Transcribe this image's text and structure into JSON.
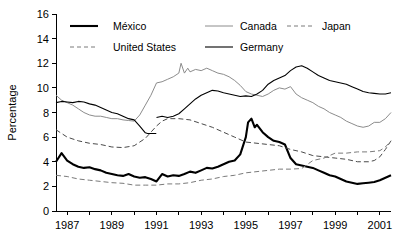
{
  "chart_data": {
    "type": "line",
    "title": "",
    "xlabel": "",
    "ylabel": "Percentage",
    "xlim": [
      1986.5,
      2001.5
    ],
    "ylim": [
      0,
      16
    ],
    "ytick_step": 2,
    "yticks": [
      0,
      2,
      4,
      6,
      8,
      10,
      12,
      14,
      16
    ],
    "ytick_labels": [
      "0",
      "2",
      "4",
      "6",
      "8",
      "10",
      "12",
      "14",
      "16"
    ],
    "xticks": [
      1987,
      1989,
      1991,
      1993,
      1995,
      1997,
      1999,
      2001
    ],
    "xtick_labels": [
      "1987",
      "1989",
      "1991",
      "1993",
      "1995",
      "1997",
      "1999",
      "2001"
    ],
    "xtick_minor_step": 1,
    "grid": false,
    "legend_position": "top-inside",
    "series": [
      {
        "name": "México",
        "color": "#000000",
        "width": 2.1,
        "dash": "none",
        "x": [
          1986.5,
          1986.75,
          1987,
          1987.25,
          1987.5,
          1987.75,
          1988,
          1988.25,
          1988.5,
          1988.75,
          1989,
          1989.25,
          1989.5,
          1989.75,
          1990,
          1990.25,
          1990.5,
          1990.75,
          1991,
          1991.25,
          1991.5,
          1991.75,
          1992,
          1992.25,
          1992.5,
          1992.75,
          1993,
          1993.25,
          1993.5,
          1993.75,
          1994,
          1994.25,
          1994.5,
          1994.75,
          1995,
          1995.1,
          1995.25,
          1995.4,
          1995.5,
          1995.75,
          1996,
          1996.25,
          1996.5,
          1996.75,
          1997,
          1997.25,
          1997.5,
          1997.75,
          1998,
          1998.25,
          1998.5,
          1998.75,
          1999,
          1999.25,
          1999.5,
          1999.75,
          2000,
          2000.25,
          2000.5,
          2000.75,
          2001,
          2001.25,
          2001.5
        ],
        "values": [
          4.0,
          4.7,
          4.1,
          3.8,
          3.6,
          3.5,
          3.55,
          3.4,
          3.3,
          3.1,
          3.0,
          2.9,
          2.85,
          3.0,
          2.8,
          2.7,
          2.75,
          2.6,
          2.4,
          3.0,
          2.8,
          2.9,
          2.85,
          3.0,
          3.2,
          3.1,
          3.3,
          3.5,
          3.45,
          3.6,
          3.8,
          4.0,
          4.1,
          4.6,
          6.0,
          7.2,
          7.5,
          6.8,
          7.0,
          6.4,
          6.0,
          5.7,
          5.6,
          5.4,
          4.3,
          3.8,
          3.7,
          3.6,
          3.5,
          3.3,
          3.1,
          2.9,
          2.8,
          2.6,
          2.4,
          2.3,
          2.2,
          2.25,
          2.3,
          2.35,
          2.5,
          2.7,
          2.9
        ]
      },
      {
        "name": "United States",
        "color": "#4a4a4a",
        "width": 1.0,
        "dash": "5,3",
        "x": [
          1986.5,
          1986.75,
          1987,
          1987.5,
          1988,
          1988.5,
          1989,
          1989.5,
          1990,
          1990.5,
          1991,
          1991.25,
          1991.5,
          1992,
          1992.5,
          1993,
          1993.5,
          1994,
          1994.5,
          1995,
          1995.5,
          1996,
          1996.5,
          1997,
          1997.5,
          1998,
          1998.5,
          1999,
          1999.5,
          2000,
          2000.5,
          2000.75,
          2001,
          2001.25,
          2001.5
        ],
        "values": [
          6.6,
          6.3,
          6.0,
          5.7,
          5.5,
          5.4,
          5.2,
          5.15,
          5.3,
          5.9,
          6.9,
          7.3,
          7.5,
          7.5,
          7.4,
          7.1,
          6.8,
          6.4,
          6.0,
          5.6,
          5.5,
          5.4,
          5.3,
          5.0,
          4.8,
          4.5,
          4.4,
          4.3,
          4.2,
          4.0,
          4.0,
          4.1,
          4.4,
          5.0,
          5.7
        ]
      },
      {
        "name": "Canada",
        "color": "#8c8c8c",
        "width": 1.0,
        "dash": "none",
        "x": [
          1986.5,
          1986.75,
          1987,
          1987.25,
          1987.5,
          1987.75,
          1988,
          1988.25,
          1988.5,
          1988.75,
          1989,
          1989.25,
          1989.5,
          1989.75,
          1990,
          1990.25,
          1990.5,
          1990.75,
          1991,
          1991.25,
          1991.5,
          1991.75,
          1992,
          1992.1,
          1992.25,
          1992.4,
          1992.5,
          1992.75,
          1993,
          1993.25,
          1993.5,
          1993.75,
          1994,
          1994.25,
          1994.5,
          1994.75,
          1995,
          1995.25,
          1995.5,
          1995.75,
          1996,
          1996.25,
          1996.5,
          1996.75,
          1997,
          1997.25,
          1997.5,
          1997.75,
          1998,
          1998.25,
          1998.5,
          1998.75,
          1999,
          1999.25,
          1999.5,
          1999.75,
          2000,
          2000.25,
          2000.5,
          2000.75,
          2001,
          2001.25,
          2001.5
        ],
        "values": [
          9.4,
          9.0,
          8.8,
          8.6,
          8.3,
          8.0,
          7.8,
          7.7,
          7.7,
          7.6,
          7.5,
          7.5,
          7.4,
          7.35,
          7.3,
          7.8,
          8.6,
          9.4,
          10.4,
          10.5,
          10.7,
          10.9,
          11.2,
          12.0,
          11.2,
          11.6,
          11.3,
          11.5,
          11.4,
          11.6,
          11.4,
          11.2,
          11.1,
          10.9,
          10.6,
          10.2,
          9.7,
          9.5,
          9.4,
          9.3,
          9.5,
          9.8,
          10.0,
          9.9,
          10.1,
          9.5,
          9.2,
          9.0,
          8.8,
          8.5,
          8.3,
          8.0,
          7.8,
          7.6,
          7.3,
          7.1,
          6.9,
          6.8,
          6.9,
          7.2,
          7.2,
          7.5,
          8.0
        ]
      },
      {
        "name": "Germany",
        "color": "#000000",
        "width": 1.1,
        "dash": "none",
        "x": [
          1986.5,
          1986.75,
          1987,
          1987.25,
          1987.5,
          1987.75,
          1988,
          1988.25,
          1988.5,
          1988.75,
          1989,
          1989.25,
          1989.5,
          1989.75,
          1990,
          1990.25,
          1990.5,
          1990.6,
          1990.99
        ],
        "values": [
          8.8,
          8.9,
          8.85,
          8.8,
          8.9,
          8.85,
          8.7,
          8.6,
          8.4,
          8.2,
          8.0,
          7.9,
          7.7,
          7.5,
          7.4,
          6.9,
          6.35,
          6.3,
          6.3
        ],
        "segment2_x": [
          1991,
          1991.25,
          1991.5,
          1991.75,
          1992,
          1992.25,
          1992.5,
          1992.75,
          1993,
          1993.25,
          1993.5,
          1993.75,
          1994,
          1994.25,
          1994.5,
          1994.75,
          1995,
          1995.25,
          1995.5,
          1995.75,
          1996,
          1996.25,
          1996.5,
          1996.75,
          1997,
          1997.25,
          1997.5,
          1997.75,
          1998,
          1998.25,
          1998.5,
          1998.75,
          1999,
          1999.25,
          1999.5,
          1999.75,
          2000,
          2000.25,
          2000.5,
          2000.75,
          2001,
          2001.25,
          2001.5
        ],
        "segment2_values": [
          7.6,
          7.7,
          7.6,
          7.7,
          7.9,
          8.3,
          8.7,
          9.1,
          9.4,
          9.6,
          9.8,
          9.75,
          9.6,
          9.5,
          9.4,
          9.3,
          9.35,
          9.3,
          9.5,
          9.8,
          10.3,
          10.6,
          10.8,
          11.0,
          11.4,
          11.7,
          11.8,
          11.6,
          11.3,
          11.0,
          10.8,
          10.6,
          10.5,
          10.4,
          10.3,
          10.1,
          9.9,
          9.7,
          9.6,
          9.55,
          9.5,
          9.5,
          9.6
        ]
      },
      {
        "name": "Japan",
        "color": "#7a7a7a",
        "width": 1.0,
        "dash": "5,3",
        "x": [
          1986.5,
          1987,
          1987.5,
          1988,
          1988.5,
          1989,
          1989.5,
          1990,
          1990.5,
          1991,
          1991.5,
          1992,
          1992.5,
          1993,
          1993.5,
          1994,
          1994.5,
          1995,
          1995.5,
          1996,
          1996.5,
          1997,
          1997.5,
          1998,
          1998.5,
          1999,
          1999.5,
          2000,
          2000.5,
          2001,
          2001.25,
          2001.5
        ],
        "values": [
          2.9,
          2.8,
          2.6,
          2.5,
          2.4,
          2.3,
          2.25,
          2.1,
          2.1,
          2.1,
          2.2,
          2.2,
          2.3,
          2.5,
          2.6,
          2.8,
          2.9,
          3.1,
          3.2,
          3.3,
          3.4,
          3.4,
          3.45,
          4.1,
          4.3,
          4.7,
          4.7,
          4.8,
          4.8,
          4.9,
          5.2,
          5.7
        ]
      }
    ]
  },
  "legend": {
    "items": [
      {
        "label": "México",
        "style": "thick-solid-black"
      },
      {
        "label": "Canada",
        "style": "thin-solid-gray"
      },
      {
        "label": "Japan",
        "style": "dashed-gray"
      },
      {
        "label": "United States",
        "style": "dashed-gray"
      },
      {
        "label": "Germany",
        "style": "thin-solid-black"
      }
    ]
  },
  "axis": {
    "y_title": "Percentage"
  }
}
